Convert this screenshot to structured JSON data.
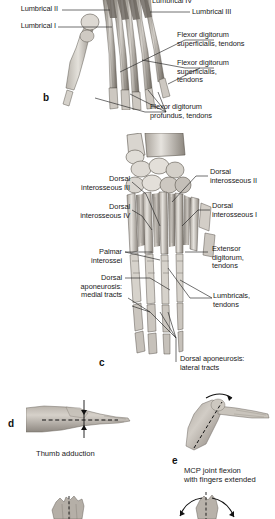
{
  "figure": {
    "kind": "anatomical-illustration",
    "colors": {
      "background": "#ffffff",
      "label_text": "#1a1a1a",
      "leader_line": "#232323",
      "bone_light": "#e7e4df",
      "bone_mid": "#bdb8b1",
      "bone_dark": "#8c867e",
      "tendon_light": "#d8d4ce",
      "tendon_dark": "#6f6a63",
      "skin_light": "#cfcac3",
      "skin_mid": "#a8a29a",
      "skin_dark": "#746f68"
    }
  },
  "panels": [
    {
      "id": "b",
      "letter": "b",
      "view": "palmar view of hand skeleton with flexor tendons and lumbricals",
      "labels": [
        {
          "id": "lumbrical-iv",
          "text": "Lumbrical IV",
          "side": "right",
          "clipped_top": true
        },
        {
          "id": "lumbrical-iii",
          "text": "Lumbrical III",
          "side": "right"
        },
        {
          "id": "lumbrical-ii",
          "text": "Lumbrical II",
          "side": "left"
        },
        {
          "id": "lumbrical-i",
          "text": "Lumbrical I",
          "side": "left"
        },
        {
          "id": "fds-tendons-1",
          "text": "Flexor digitorum\nsuperficialis, tendons",
          "side": "right"
        },
        {
          "id": "fds-tendons-2",
          "text": "Flexor digitorum\nsuperficialis,\ntendons",
          "side": "right"
        },
        {
          "id": "fdp-tendons",
          "text": "Flexor digitorum\nprofundus, tendons",
          "side": "right"
        }
      ]
    },
    {
      "id": "c",
      "letter": "c",
      "view": "dorsal view of hand skeleton with interossei and dorsal aponeurosis",
      "labels": [
        {
          "id": "dorsal-interosseous-ii",
          "text": "Dorsal\ninterosseous II",
          "side": "right"
        },
        {
          "id": "dorsal-interosseous-i",
          "text": "Dorsal\ninterosseous I",
          "side": "right"
        },
        {
          "id": "dorsal-interosseous-iii",
          "text": "Dorsal\ninterosseous III",
          "side": "left"
        },
        {
          "id": "dorsal-interosseous-iv",
          "text": "Dorsal\ninterosseous IV",
          "side": "left"
        },
        {
          "id": "palmar-interossei",
          "text": "Palmar\ninterossei",
          "side": "left"
        },
        {
          "id": "dorsal-aponeurosis-medial",
          "text": "Dorsal\naponeurosis:\nmedial tracts",
          "side": "left"
        },
        {
          "id": "extensor-digitorum-tendons",
          "text": "Extensor\ndigitorum,\ntendons",
          "side": "right"
        },
        {
          "id": "lumbricals-tendons",
          "text": "Lumbricals,\ntendons",
          "side": "right"
        },
        {
          "id": "dorsal-aponeurosis-lateral",
          "text": "Dorsal aponeurosis:\nlateral tracts",
          "side": "bottom"
        }
      ]
    },
    {
      "id": "d",
      "letter": "d",
      "view": "photograph of hand demonstrating thumb adduction",
      "caption": "Thumb adduction",
      "labels": []
    },
    {
      "id": "e",
      "letter": "e",
      "view": "photograph of hand demonstrating MCP joint flexion",
      "caption": "MCP joint flexion\nwith fingers extended",
      "labels": []
    },
    {
      "id": "f-partial",
      "letter": "",
      "view": "partially visible hand photograph at bottom left, cut off by image edge",
      "caption": "",
      "labels": []
    },
    {
      "id": "g-partial",
      "letter": "",
      "view": "partially visible hand photograph with curved arrows at bottom right, cut off by image edge",
      "caption": "",
      "labels": []
    }
  ]
}
